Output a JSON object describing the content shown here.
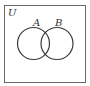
{
  "diagram": {
    "type": "venn",
    "universe_label": "U",
    "sets": [
      {
        "label": "A"
      },
      {
        "label": "B"
      }
    ],
    "colors": {
      "stroke": "#3a3a3a",
      "frame": "#6a6a6a",
      "background": "#ffffff"
    }
  }
}
